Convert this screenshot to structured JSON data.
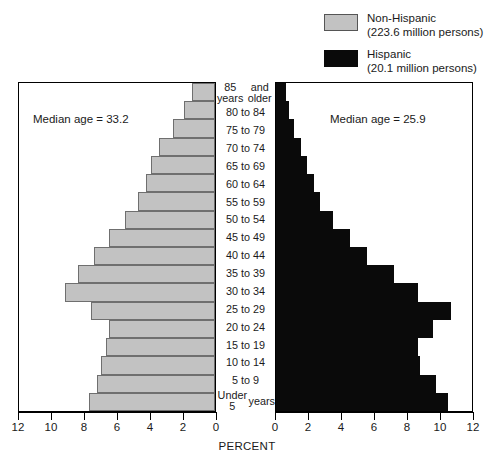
{
  "legend": {
    "items": [
      {
        "label": "Non-Hispanic",
        "detail": "(223.6 million persons)",
        "swatch": "gray-swatch",
        "color": "#c2c2c2"
      },
      {
        "label": "Hispanic",
        "detail": "(20.1 million persons)",
        "swatch": "black-swatch",
        "color": "#0a0a0a"
      }
    ]
  },
  "annotations": {
    "median_left": "Median age = 33.2",
    "median_right": "Median age = 25.9"
  },
  "axis": {
    "title": "PERCENT",
    "left_ticks": [
      "12",
      "10",
      "8",
      "6",
      "4",
      "2",
      "0"
    ],
    "right_ticks": [
      "0",
      "2",
      "4",
      "6",
      "8",
      "10",
      "12"
    ]
  },
  "chart_data": {
    "type": "bar",
    "subtype": "population-pyramid",
    "title": "",
    "xlabel": "PERCENT",
    "ylabel": "",
    "xlim": [
      0,
      12
    ],
    "grid": false,
    "legend_position": "top-right",
    "categories": [
      "85 years and older",
      "80 to 84",
      "75 to 79",
      "70 to 74",
      "65 to 69",
      "60 to 64",
      "55 to 59",
      "50 to 54",
      "45 to 49",
      "40 to 44",
      "35 to 39",
      "30 to 34",
      "25 to 29",
      "20 to 24",
      "15 to 19",
      "10 to 14",
      "5 to 9",
      "Under 5 years"
    ],
    "category_lines": [
      [
        "85 years",
        "and older"
      ],
      [
        "80 to 84"
      ],
      [
        "75 to 79"
      ],
      [
        "70 to 74"
      ],
      [
        "65 to 69"
      ],
      [
        "60 to 64"
      ],
      [
        "55 to 59"
      ],
      [
        "50 to 54"
      ],
      [
        "45 to 49"
      ],
      [
        "40 to 44"
      ],
      [
        "35 to 39"
      ],
      [
        "30 to 34"
      ],
      [
        "25 to 29"
      ],
      [
        "20 to 24"
      ],
      [
        "15 to 19"
      ],
      [
        "10 to 14"
      ],
      [
        "5 to 9"
      ],
      [
        "Under 5",
        "years"
      ]
    ],
    "series": [
      {
        "name": "Non-Hispanic",
        "side": "left",
        "color": "#c2c2c2",
        "total_persons_millions": 223.6,
        "median_age": 33.2,
        "values": [
          1.4,
          1.9,
          2.6,
          3.4,
          3.9,
          4.2,
          4.7,
          5.5,
          6.5,
          7.4,
          8.4,
          9.2,
          7.6,
          6.5,
          6.7,
          7.0,
          7.2,
          7.7
        ]
      },
      {
        "name": "Hispanic",
        "side": "right",
        "color": "#0a0a0a",
        "total_persons_millions": 20.1,
        "median_age": 25.9,
        "values": [
          0.6,
          0.8,
          1.1,
          1.5,
          1.9,
          2.3,
          2.7,
          3.5,
          4.5,
          5.6,
          7.2,
          8.7,
          10.7,
          9.6,
          8.7,
          8.8,
          9.8,
          10.5
        ]
      }
    ]
  }
}
